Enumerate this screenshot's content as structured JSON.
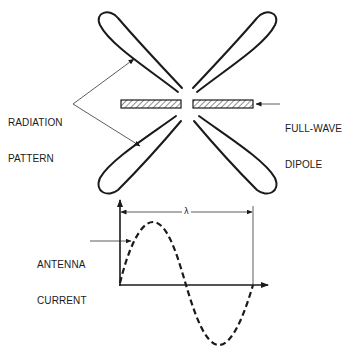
{
  "diagram": {
    "labels": {
      "radiation_pattern_line1": "RADIATION",
      "radiation_pattern_line2": "PATTERN",
      "dipole_line1": "FULL-WAVE",
      "dipole_line2": "DIPOLE",
      "current_line1": "ANTENNA",
      "current_line2": "CURRENT",
      "wavelength": "λ"
    },
    "colors": {
      "stroke": "#1a1a1a",
      "hatch": "#555555",
      "background": "#ffffff"
    },
    "components": {
      "radiation_lobes": 4,
      "dipole_segments": 2,
      "waveform": "one full sine cycle (dashed)",
      "dimension": "one wavelength"
    }
  }
}
